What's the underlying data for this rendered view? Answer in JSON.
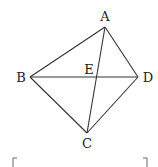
{
  "diagram": {
    "points": {
      "A": {
        "label": "A",
        "x": 105,
        "y": 27,
        "lx": 105,
        "ly": 17
      },
      "B": {
        "label": "B",
        "x": 30,
        "y": 77,
        "lx": 20,
        "ly": 81
      },
      "C": {
        "label": "C",
        "x": 87,
        "y": 133,
        "lx": 87,
        "ly": 147
      },
      "D": {
        "label": "D",
        "x": 138,
        "y": 77,
        "lx": 148,
        "ly": 81
      },
      "E": {
        "label": "E",
        "x": 96,
        "y": 77,
        "lx": 89,
        "ly": 73
      }
    },
    "segments": [
      [
        "A",
        "B"
      ],
      [
        "A",
        "D"
      ],
      [
        "B",
        "C"
      ],
      [
        "C",
        "D"
      ],
      [
        "B",
        "D"
      ],
      [
        "A",
        "C"
      ]
    ],
    "answer_bracket": {
      "left": "[",
      "right": "]"
    }
  }
}
